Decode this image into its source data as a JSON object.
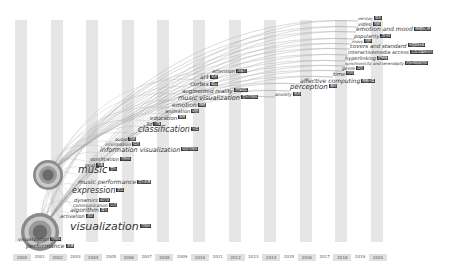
{
  "chart_data": {
    "type": "timezone-keyword-map",
    "title": "",
    "x_axis": {
      "label": "",
      "years": [
        "2000",
        "2001",
        "2002",
        "2003",
        "2004",
        "2005",
        "2006",
        "2007",
        "2008",
        "2009",
        "2010",
        "2011",
        "2012",
        "2013",
        "2014",
        "2015",
        "2016",
        "2017",
        "2018",
        "2019",
        "2020"
      ]
    },
    "nodes": [
      {
        "en": "visualization",
        "zh": "可视化",
        "year": "2000",
        "x": 70,
        "y": 232,
        "size": 11,
        "circle": 22
      },
      {
        "en": "visualization",
        "zh": "可视化",
        "year": "2000",
        "x": 18,
        "y": 242,
        "size": 5
      },
      {
        "en": "performance",
        "zh": "表演",
        "year": "2000",
        "x": 26,
        "y": 249,
        "size": 6
      },
      {
        "en": "activation",
        "zh": "激活",
        "year": "2001",
        "x": 60,
        "y": 219,
        "size": 5
      },
      {
        "en": "algorithm",
        "zh": "算法",
        "year": "2001",
        "x": 70,
        "y": 213,
        "size": 6
      },
      {
        "en": "communication",
        "zh": "交流",
        "year": "2001",
        "x": 73,
        "y": 208,
        "size": 4.5
      },
      {
        "en": "dynamics",
        "zh": "动力学",
        "year": "2001",
        "x": 74,
        "y": 203,
        "size": 5
      },
      {
        "en": "expression",
        "zh": "表达",
        "year": "2002",
        "x": 72,
        "y": 195,
        "size": 8
      },
      {
        "en": "music performance",
        "zh": "音乐表演",
        "year": "2002",
        "x": 78,
        "y": 185,
        "size": 6
      },
      {
        "en": "music",
        "zh": "音乐",
        "year": "2002",
        "x": 78,
        "y": 175,
        "size": 10,
        "circle": 18
      },
      {
        "en": "beat",
        "zh": "节奏",
        "year": "2002",
        "x": 85,
        "y": 168,
        "size": 4.5
      },
      {
        "en": "sonification",
        "zh": "可听化",
        "year": "2003",
        "x": 90,
        "y": 162,
        "size": 5
      },
      {
        "en": "information visualization",
        "zh": "信息可视化",
        "year": "2003",
        "x": 100,
        "y": 153,
        "size": 6.5
      },
      {
        "en": "information",
        "zh": "信息",
        "year": "2003",
        "x": 105,
        "y": 147,
        "size": 4.5
      },
      {
        "en": "audio",
        "zh": "音频",
        "year": "2004",
        "x": 115,
        "y": 142,
        "size": 4.5
      },
      {
        "en": "classification",
        "zh": "分类",
        "year": "2005",
        "x": 138,
        "y": 134,
        "size": 8
      },
      {
        "en": "3d",
        "zh": "三维",
        "year": "2006",
        "x": 146,
        "y": 127,
        "size": 5
      },
      {
        "en": "education",
        "zh": "教育",
        "year": "2006",
        "x": 150,
        "y": 121,
        "size": 5.5
      },
      {
        "en": "animation",
        "zh": "动画",
        "year": "2007",
        "x": 165,
        "y": 114,
        "size": 5
      },
      {
        "en": "emotion",
        "zh": "情绪",
        "year": "2007",
        "x": 172,
        "y": 108,
        "size": 6
      },
      {
        "en": "music visualization",
        "zh": "音乐可视化",
        "year": "2008",
        "x": 178,
        "y": 101,
        "size": 6.5
      },
      {
        "en": "augmented reality",
        "zh": "增强现实",
        "year": "2008",
        "x": 182,
        "y": 94,
        "size": 5.5
      },
      {
        "en": "cortex",
        "zh": "皮层",
        "year": "2008",
        "x": 190,
        "y": 87,
        "size": 6
      },
      {
        "en": "art",
        "zh": "艺术",
        "year": "2009",
        "x": 200,
        "y": 80,
        "size": 6
      },
      {
        "en": "attention",
        "zh": "注意力",
        "year": "2009",
        "x": 212,
        "y": 74,
        "size": 5
      },
      {
        "en": "anxiety",
        "zh": "焦虑",
        "year": "2015",
        "x": 275,
        "y": 97,
        "size": 4.5
      },
      {
        "en": "perception",
        "zh": "感知",
        "year": "2015",
        "x": 290,
        "y": 91,
        "size": 7
      },
      {
        "en": "affective computing",
        "zh": "情感计算",
        "year": "2016",
        "x": 300,
        "y": 84,
        "size": 6
      },
      {
        "en": "time",
        "zh": "时间",
        "year": "2017",
        "x": 333,
        "y": 77,
        "size": 5.5
      },
      {
        "en": "genre",
        "zh": "类型",
        "year": "2018",
        "x": 342,
        "y": 71,
        "size": 4.5
      },
      {
        "en": "synchronicity and serendipity",
        "zh": "同步性和偶然性",
        "year": "2018",
        "x": 345,
        "y": 66,
        "size": 4
      },
      {
        "en": "hyperlinking",
        "zh": "超链接",
        "year": "2018",
        "x": 345,
        "y": 61,
        "size": 5
      },
      {
        "en": "interactivemedia access",
        "zh": "交互式媒体访问",
        "year": "2018",
        "x": 348,
        "y": 55,
        "size": 5
      },
      {
        "en": "covers and standard",
        "zh": "封面和标准",
        "year": "2018",
        "x": 350,
        "y": 49,
        "size": 5.5
      },
      {
        "en": "movy",
        "zh": "电影",
        "year": "2019",
        "x": 352,
        "y": 44,
        "size": 4
      },
      {
        "en": "popularity",
        "zh": "流行性",
        "year": "2019",
        "x": 354,
        "y": 39,
        "size": 5
      },
      {
        "en": "emotion and mood",
        "zh": "情绪和心情",
        "year": "2019",
        "x": 356,
        "y": 32,
        "size": 6
      },
      {
        "en": "video",
        "zh": "视频",
        "year": "2019",
        "x": 358,
        "y": 27,
        "size": 5
      },
      {
        "en": "version",
        "zh": "版本",
        "year": "2019",
        "x": 358,
        "y": 21,
        "size": 4
      }
    ]
  }
}
